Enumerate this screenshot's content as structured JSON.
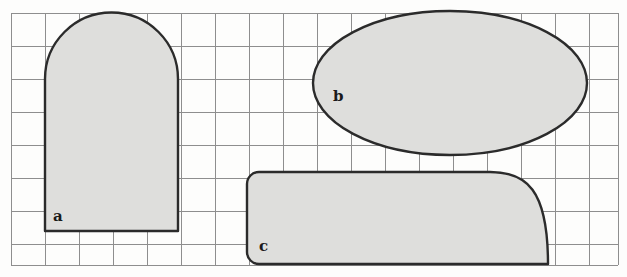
{
  "figure": {
    "background_color": "#fdfdfc",
    "grid": {
      "line_color": "#8e8e8e",
      "line_width": 1,
      "cell_size": 34,
      "origin_x": 11,
      "origin_y": 13,
      "columns": 18,
      "rows": 7.4,
      "x_lines": [
        11,
        45,
        79,
        113,
        147,
        181,
        215,
        249,
        283,
        317,
        351,
        385,
        419,
        453,
        487,
        521,
        555,
        589,
        618
      ],
      "y_lines": [
        13,
        46,
        79,
        112,
        145,
        178,
        211,
        244,
        265
      ]
    },
    "style": {
      "shape_fill": "#dededc",
      "shape_stroke": "#2b2b2b",
      "shape_stroke_width": 2.4,
      "label_color": "#1a1a1a"
    },
    "shapes": [
      {
        "id": "shape-a",
        "label": "a",
        "type": "rectangle-with-semicircular-top",
        "label_x": 53,
        "label_y": 221,
        "geometry": {
          "left": 45,
          "right": 178,
          "top": 13,
          "bottom": 231,
          "width": 133,
          "height": 218,
          "arc_radius": 66,
          "arc_springline_y": 79,
          "rect_height": 152
        },
        "grid_squares": "about 5 wide by 6.5 tall"
      },
      {
        "id": "shape-b",
        "label": "b",
        "type": "ellipse",
        "label_x": 333,
        "label_y": 101,
        "geometry": {
          "center_x": 450,
          "center_y": 83,
          "radius_x": 137,
          "radius_y": 72,
          "left": 313,
          "right": 587,
          "top": 11,
          "bottom": 155
        },
        "grid_squares": "about 8 wide by 4.2 tall"
      },
      {
        "id": "shape-c",
        "label": "c",
        "type": "rounded-rectangle-with-quarter-round-right-end",
        "label_x": 259,
        "label_y": 251,
        "geometry": {
          "left": 247,
          "right": 548,
          "top": 172,
          "bottom": 264,
          "width": 301,
          "height": 92,
          "corner_radius_left": 12,
          "quarter_round_radius": 58,
          "curve_start_x": 490
        },
        "grid_squares": "about 9 wide by 2.7 tall"
      }
    ]
  }
}
